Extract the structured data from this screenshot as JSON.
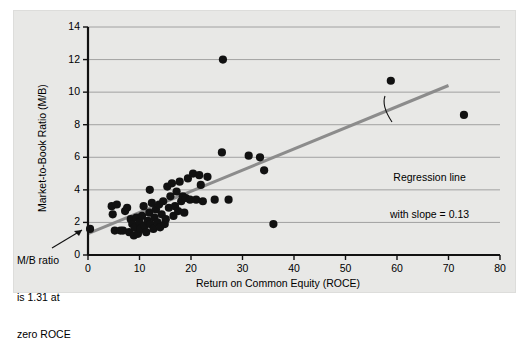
{
  "chart_data": {
    "type": "scatter",
    "title": "",
    "xlabel": "Return on Common Equity (ROCE)",
    "ylabel": "Market-to-Book Ratio (M/B)",
    "xlim": [
      0,
      80
    ],
    "ylim": [
      0,
      14
    ],
    "xticks": [
      0,
      10,
      20,
      30,
      40,
      50,
      60,
      70,
      80
    ],
    "yticks": [
      0,
      2,
      4,
      6,
      8,
      10,
      12,
      14
    ],
    "grid": "horizontal",
    "legend": "none",
    "marker_color": "#111111",
    "regression": {
      "intercept": 1.31,
      "slope": 0.13,
      "color": "#8c8c8c",
      "x_start": 0,
      "x_end": 70
    },
    "annotations": [
      {
        "name": "regression-note",
        "lines": [
          "Regression line",
          "with slope = 0.13"
        ]
      },
      {
        "name": "intercept-note",
        "lines": [
          "M/B ratio",
          "is 1.31 at",
          "zero ROCE"
        ]
      }
    ],
    "points": [
      {
        "x": 0.4,
        "y": 1.6
      },
      {
        "x": 4.6,
        "y": 3.0
      },
      {
        "x": 4.8,
        "y": 2.5
      },
      {
        "x": 5.2,
        "y": 1.5
      },
      {
        "x": 5.6,
        "y": 3.1
      },
      {
        "x": 6.3,
        "y": 1.5
      },
      {
        "x": 6.8,
        "y": 1.5
      },
      {
        "x": 7.2,
        "y": 2.7
      },
      {
        "x": 7.6,
        "y": 2.9
      },
      {
        "x": 8.0,
        "y": 1.4
      },
      {
        "x": 8.3,
        "y": 2.2
      },
      {
        "x": 8.6,
        "y": 1.9
      },
      {
        "x": 8.9,
        "y": 1.2
      },
      {
        "x": 9.1,
        "y": 1.7
      },
      {
        "x": 9.4,
        "y": 2.3
      },
      {
        "x": 9.7,
        "y": 1.3
      },
      {
        "x": 10.0,
        "y": 2.0
      },
      {
        "x": 10.2,
        "y": 1.6
      },
      {
        "x": 10.5,
        "y": 2.4
      },
      {
        "x": 10.8,
        "y": 3.0
      },
      {
        "x": 11.0,
        "y": 1.8
      },
      {
        "x": 11.3,
        "y": 1.4
      },
      {
        "x": 11.6,
        "y": 2.1
      },
      {
        "x": 11.9,
        "y": 2.6
      },
      {
        "x": 12.1,
        "y": 1.9
      },
      {
        "x": 12.4,
        "y": 3.2
      },
      {
        "x": 12.7,
        "y": 1.6
      },
      {
        "x": 12.9,
        "y": 2.3
      },
      {
        "x": 13.2,
        "y": 2.8
      },
      {
        "x": 13.5,
        "y": 2.0
      },
      {
        "x": 13.8,
        "y": 3.1
      },
      {
        "x": 14.0,
        "y": 1.7
      },
      {
        "x": 14.3,
        "y": 2.5
      },
      {
        "x": 14.6,
        "y": 3.3
      },
      {
        "x": 14.9,
        "y": 1.9
      },
      {
        "x": 15.1,
        "y": 2.2
      },
      {
        "x": 15.4,
        "y": 4.2
      },
      {
        "x": 15.7,
        "y": 2.9
      },
      {
        "x": 16.0,
        "y": 3.6
      },
      {
        "x": 16.3,
        "y": 4.4
      },
      {
        "x": 16.6,
        "y": 2.4
      },
      {
        "x": 16.9,
        "y": 3.0
      },
      {
        "x": 17.2,
        "y": 3.9
      },
      {
        "x": 17.5,
        "y": 2.7
      },
      {
        "x": 17.8,
        "y": 4.5
      },
      {
        "x": 18.1,
        "y": 3.3
      },
      {
        "x": 18.4,
        "y": 3.6
      },
      {
        "x": 18.7,
        "y": 2.6
      },
      {
        "x": 19.0,
        "y": 3.5
      },
      {
        "x": 19.4,
        "y": 4.7
      },
      {
        "x": 12.0,
        "y": 4.0
      },
      {
        "x": 19.8,
        "y": 3.4
      },
      {
        "x": 20.4,
        "y": 5.0
      },
      {
        "x": 21.0,
        "y": 3.4
      },
      {
        "x": 21.6,
        "y": 4.9
      },
      {
        "x": 21.9,
        "y": 4.3
      },
      {
        "x": 22.3,
        "y": 3.3
      },
      {
        "x": 23.2,
        "y": 4.8
      },
      {
        "x": 24.6,
        "y": 3.4
      },
      {
        "x": 26.2,
        "y": 12.0
      },
      {
        "x": 26.0,
        "y": 6.3
      },
      {
        "x": 27.3,
        "y": 3.4
      },
      {
        "x": 31.2,
        "y": 6.1
      },
      {
        "x": 33.4,
        "y": 6.0
      },
      {
        "x": 34.2,
        "y": 5.2
      },
      {
        "x": 36.0,
        "y": 1.9
      },
      {
        "x": 58.8,
        "y": 10.7
      },
      {
        "x": 73.0,
        "y": 8.6
      }
    ]
  }
}
